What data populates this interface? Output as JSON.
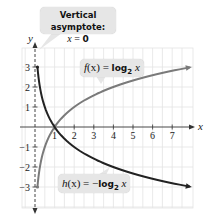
{
  "chart_data": {
    "type": "line",
    "title": "",
    "xlabel": "x",
    "ylabel": "y",
    "xlim": [
      0,
      7.9
    ],
    "ylim": [
      -4,
      4
    ],
    "grid": true,
    "x_ticks": [
      1,
      2,
      3,
      4,
      5,
      6,
      7
    ],
    "y_ticks": [
      3,
      2,
      1,
      -1,
      -2,
      -3
    ],
    "x_tick_labels": [
      "1",
      "2",
      "3",
      "4",
      "5",
      "6",
      "7"
    ],
    "y_tick_labels": [
      "3",
      "2",
      "1",
      "−1",
      "−2",
      "−3"
    ],
    "series": [
      {
        "name": "f(x) = log2 x",
        "function": "log2(x)",
        "color": "#7a7a7a",
        "x": [
          0.125,
          0.25,
          0.5,
          1,
          2,
          4,
          7.9
        ],
        "values": [
          -3,
          -2,
          -1,
          0,
          1,
          2,
          2.98
        ]
      },
      {
        "name": "h(x) = -log2 x",
        "function": "-log2(x)",
        "color": "#222222",
        "x": [
          0.125,
          0.25,
          0.5,
          1,
          2,
          4,
          7.9
        ],
        "values": [
          3,
          2,
          1,
          0,
          -1,
          -2,
          -2.98
        ]
      }
    ],
    "annotations": [
      {
        "text": "Vertical asymptote: x = 0",
        "type": "asymptote",
        "x": 0
      },
      {
        "text": "f(x) = log2 x",
        "target_series": 0
      },
      {
        "text": "h(x) = −log2 x",
        "target_series": 1
      }
    ],
    "intersection": {
      "x": 1,
      "y": 0
    }
  },
  "callouts": {
    "asymptote_title": "Vertical asymptote:",
    "asymptote_eq_var": "x",
    "asymptote_eq_rest": " = ",
    "asymptote_eq_val": "0",
    "f_name": "f",
    "f_paren": "(x) = ",
    "f_log": "log",
    "f_base": "2",
    "f_arg": " x",
    "h_name": "h",
    "h_paren": "(x) = −",
    "h_log": "log",
    "h_base": "2",
    "h_arg": " x"
  }
}
